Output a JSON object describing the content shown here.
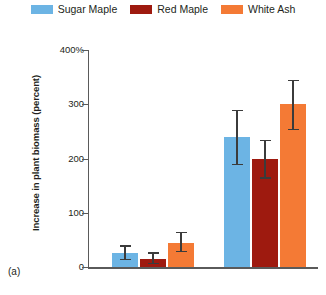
{
  "panel_label": "(a)",
  "legend": {
    "entries": [
      {
        "label": "Sugar Maple",
        "color": "#6cb4e4"
      },
      {
        "label": "Red Maple",
        "color": "#9e1a0f"
      },
      {
        "label": "White Ash",
        "color": "#f47a35"
      }
    ]
  },
  "axis": {
    "ylabel": "Increase in plant biomass (percent)",
    "yticks": [
      "0",
      "100",
      "200",
      "300",
      "400%"
    ]
  },
  "chart_data": {
    "type": "bar",
    "title": "",
    "xlabel": "",
    "ylabel": "Increase in plant biomass (percent)",
    "ylim": [
      0,
      400
    ],
    "yticks": [
      0,
      100,
      200,
      300,
      400
    ],
    "ytick_labels": [
      "0",
      "100",
      "200",
      "300",
      "400%"
    ],
    "grid": false,
    "legend_position": "top-center",
    "categories": [
      "group-1",
      "group-2"
    ],
    "series": [
      {
        "name": "Sugar Maple",
        "color": "#6cb4e4",
        "values": [
          25,
          240
        ],
        "errors_low": [
          10,
          50
        ],
        "errors_high": [
          15,
          50
        ]
      },
      {
        "name": "Red Maple",
        "color": "#9e1a0f",
        "values": [
          15,
          200
        ],
        "errors_low": [
          8,
          35
        ],
        "errors_high": [
          12,
          35
        ]
      },
      {
        "name": "White Ash",
        "color": "#f47a35",
        "values": [
          45,
          300
        ],
        "errors_low": [
          15,
          45
        ],
        "errors_high": [
          20,
          45
        ]
      }
    ],
    "annotations": [
      "(a)"
    ]
  }
}
